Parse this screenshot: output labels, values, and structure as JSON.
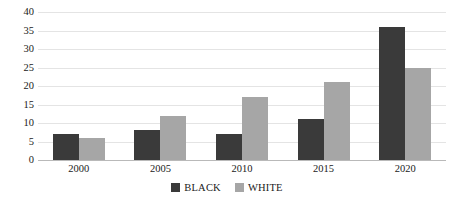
{
  "chart_data": {
    "type": "bar",
    "title": "",
    "xlabel": "",
    "ylabel": "",
    "categories": [
      "2000",
      "2005",
      "2010",
      "2015",
      "2020"
    ],
    "series": [
      {
        "name": "BLACK",
        "color": "#3a3a3a",
        "values": [
          7,
          8,
          7,
          11,
          36
        ]
      },
      {
        "name": "WHITE",
        "color": "#a6a6a6",
        "values": [
          6,
          12,
          17,
          21,
          25
        ]
      }
    ],
    "ylim": [
      0,
      40
    ],
    "ytick_labels": [
      "0",
      "5",
      "10",
      "15",
      "20",
      "25",
      "30",
      "35",
      "40"
    ],
    "ytick_values": [
      0,
      5,
      10,
      15,
      20,
      25,
      30,
      35,
      40
    ],
    "grid": true,
    "legend_position": "bottom"
  },
  "legend": {
    "entries": [
      {
        "label": "BLACK"
      },
      {
        "label": "WHITE"
      }
    ]
  },
  "colors": {
    "series_black": "#3a3a3a",
    "series_white": "#a6a6a6",
    "gridline": "#e4e4e4",
    "axis": "#b9b9b9",
    "text": "#1a1a1a",
    "background": "#ffffff"
  }
}
